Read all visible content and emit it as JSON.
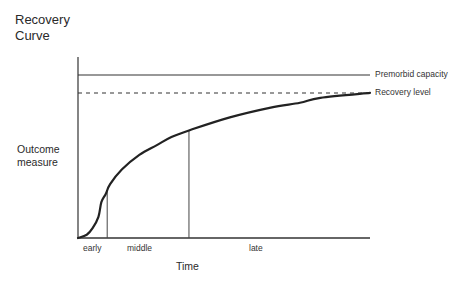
{
  "title_lines": [
    "Recovery",
    "Curve"
  ],
  "y_axis_label_lines": [
    "Outcome",
    "measure"
  ],
  "x_axis_label": "Time",
  "reference_lines": {
    "premorbid": {
      "label": "Premorbid capacity",
      "style": "solid",
      "level": 1.0
    },
    "recovery": {
      "label": "Recovery level",
      "style": "dashed",
      "level": 0.89
    }
  },
  "phases": [
    {
      "label": "early",
      "end_fraction": 0.1
    },
    {
      "label": "middle",
      "end_fraction": 0.38
    },
    {
      "label": "late",
      "end_fraction": 1.0
    }
  ],
  "chart_data": {
    "type": "line",
    "title": "Recovery Curve",
    "xlabel": "Time",
    "ylabel": "Outcome measure",
    "x_range": [
      0,
      1
    ],
    "y_range": [
      0,
      1
    ],
    "grid": false,
    "series": [
      {
        "name": "Recovery curve",
        "x": [
          0,
          0.03,
          0.05,
          0.07,
          0.08,
          0.095,
          0.11,
          0.15,
          0.21,
          0.27,
          0.32,
          0.38,
          0.52,
          0.66,
          0.76,
          0.83,
          1.0
        ],
        "y": [
          0,
          0.02,
          0.06,
          0.13,
          0.22,
          0.27,
          0.33,
          0.42,
          0.51,
          0.57,
          0.62,
          0.66,
          0.74,
          0.8,
          0.83,
          0.86,
          0.89
        ]
      }
    ],
    "annotations": [
      {
        "text": "Premorbid capacity",
        "y": 1.0
      },
      {
        "text": "Recovery level",
        "y": 0.89
      },
      {
        "text": "early",
        "x_span": [
          0,
          0.1
        ]
      },
      {
        "text": "middle",
        "x_span": [
          0.1,
          0.38
        ]
      },
      {
        "text": "late",
        "x_span": [
          0.38,
          1.0
        ]
      }
    ]
  }
}
